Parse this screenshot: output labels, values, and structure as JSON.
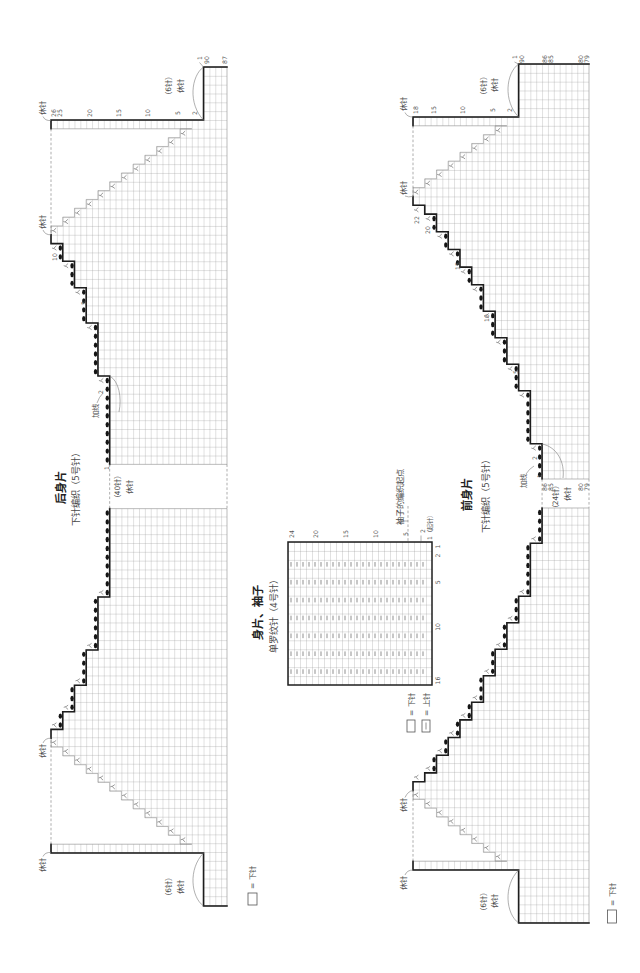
{
  "colors": {
    "outline": "#1e1e1e",
    "grid": "#8f8f8f",
    "dot": "#151515",
    "text": "#3a3a3a",
    "dashed": "#8a8a8a",
    "background": "#ffffff"
  },
  "symbols": {
    "decrease": "人",
    "cast_on": "●",
    "purl": "｜",
    "knit": "□"
  },
  "back_piece": {
    "title": "后身片",
    "subtitle": "下针编织（5号针）",
    "legend_text": "= 下针",
    "geometry": {
      "x0": 51,
      "y_top": 67,
      "cell_w": 5.867,
      "cell_h": 8.83,
      "strip_rows": 26,
      "total_rows": 30,
      "block_sts": 6,
      "dec_steps": 12,
      "arm_steps": [
        1,
        2,
        3,
        4,
        6
      ],
      "dot_from": 1,
      "gap_sts": 45,
      "mirror_sum": 973
    },
    "labels": [
      {
        "text": "1",
        "x": 199.2,
        "y": 58
      },
      {
        "text": "90",
        "x": 206.4,
        "y": 60
      },
      {
        "text": "87",
        "x": 224,
        "y": 60
      },
      {
        "text": "26",
        "x": 53.9,
        "y": 113
      },
      {
        "text": "25",
        "x": 59.8,
        "y": 113
      },
      {
        "text": "20",
        "x": 89.1,
        "y": 113
      },
      {
        "text": "15",
        "x": 118.5,
        "y": 113
      },
      {
        "text": "10",
        "x": 147.8,
        "y": 113
      },
      {
        "text": "5",
        "x": 177.2,
        "y": 113
      },
      {
        "text": "2",
        "x": 194.8,
        "y": 113
      },
      {
        "text": "10",
        "x": 54,
        "y": 257
      },
      {
        "text": "5",
        "x": 83.3,
        "y": 303
      },
      {
        "text": "2",
        "x": 100.9,
        "y": 392
      },
      {
        "text": "1",
        "x": 106.4,
        "y": 468
      },
      {
        "text": "休针",
        "x": 42,
        "y": 108,
        "cls": "note",
        "name": "held-stitches-label"
      },
      {
        "text": "休针",
        "x": 42,
        "y": 222,
        "cls": "note",
        "name": "held-stitches-label"
      },
      {
        "text": "（6针）",
        "x": 168.5,
        "y": 86,
        "cls": "note",
        "name": "stitch-count-label"
      },
      {
        "text": "休针",
        "x": 180,
        "y": 86,
        "cls": "note",
        "name": "held-stitches-label"
      },
      {
        "text": "加线",
        "x": 95,
        "y": 411,
        "cls": "note",
        "name": "join-yarn-label"
      },
      {
        "text": "（40针）",
        "x": 117,
        "y": 487,
        "cls": "note",
        "name": "stitch-count-label"
      },
      {
        "text": "休针",
        "x": 129,
        "y": 487,
        "cls": "note",
        "name": "held-stitches-label"
      },
      {
        "text": "休针",
        "x": 42,
        "y": 751,
        "cls": "note",
        "name": "held-stitches-label"
      },
      {
        "text": "休针",
        "x": 42,
        "y": 865,
        "cls": "note",
        "name": "held-stitches-label"
      },
      {
        "text": "（6针）",
        "x": 168.5,
        "y": 887,
        "cls": "note",
        "name": "stitch-count-label"
      },
      {
        "text": "休针",
        "x": 180,
        "y": 887,
        "cls": "note",
        "name": "held-stitches-label"
      }
    ],
    "leaders": [
      "M43,116.5 Q45,121 51,120.5",
      "M43,230 Q45,235 51,234.8",
      "M203.5,67 C191,76 188,104 203.5,120",
      "M43,856.5 Q45,852 51,852.5",
      "M43,743 Q45,738 51,738.2",
      "M203.5,906 C191,897 188,869 203.5,853",
      "M109.7,376 C119,381 122,398 119,412",
      "M97,403 Q99,397 103,393",
      "M199.5,62.5 L203.5,67"
    ]
  },
  "front_piece": {
    "title": "前身片",
    "subtitle": "下针编织（5号针）",
    "legend_text": "= 下针",
    "geometry": {
      "x0": 413,
      "y_top": 64,
      "cell_w": 5.867,
      "cell_h": 8.83,
      "strip_rows": 18,
      "total_rows": 30,
      "block_sts": 6,
      "dec_steps": 8,
      "arm_steps": [
        1,
        1,
        2,
        2,
        2,
        2,
        3,
        3,
        3,
        3,
        6
      ],
      "dot_from": 2,
      "gap_sts": 47,
      "mirror_sum": 987
    },
    "labels": [
      {
        "text": "1",
        "x": 514.5,
        "y": 57
      },
      {
        "text": "90",
        "x": 521.5,
        "y": 59
      },
      {
        "text": "86",
        "x": 544.9,
        "y": 59
      },
      {
        "text": "85",
        "x": 550.8,
        "y": 59
      },
      {
        "text": "80",
        "x": 580.1,
        "y": 59
      },
      {
        "text": "79",
        "x": 586,
        "y": 59
      },
      {
        "text": "18",
        "x": 415.9,
        "y": 110
      },
      {
        "text": "15",
        "x": 433.5,
        "y": 110
      },
      {
        "text": "10",
        "x": 462.8,
        "y": 110
      },
      {
        "text": "5",
        "x": 492.2,
        "y": 110
      },
      {
        "text": "2",
        "x": 509.8,
        "y": 110
      },
      {
        "text": "22",
        "x": 416,
        "y": 220
      },
      {
        "text": "20",
        "x": 427.7,
        "y": 230
      },
      {
        "text": "15",
        "x": 457,
        "y": 266
      },
      {
        "text": "10",
        "x": 486.4,
        "y": 318
      },
      {
        "text": "5",
        "x": 515.7,
        "y": 372
      },
      {
        "text": "2",
        "x": 534,
        "y": 458
      },
      {
        "text": "1",
        "x": 539.2,
        "y": 476
      },
      {
        "text": "86",
        "x": 544.9,
        "y": 487
      },
      {
        "text": "85",
        "x": 550.8,
        "y": 487
      },
      {
        "text": "80",
        "x": 580.1,
        "y": 487
      },
      {
        "text": "79",
        "x": 586,
        "y": 487
      },
      {
        "text": "休针",
        "x": 403,
        "y": 104,
        "cls": "note",
        "name": "held-stitches-label"
      },
      {
        "text": "休针",
        "x": 403,
        "y": 188,
        "cls": "note",
        "name": "held-stitches-label"
      },
      {
        "text": "（6针）",
        "x": 483,
        "y": 86,
        "cls": "note",
        "name": "stitch-count-label"
      },
      {
        "text": "休针",
        "x": 494,
        "y": 85,
        "cls": "note",
        "name": "held-stitches-label"
      },
      {
        "text": "加线",
        "x": 523,
        "y": 481,
        "cls": "note",
        "name": "join-yarn-label"
      },
      {
        "text": "（24针）",
        "x": 555,
        "y": 497,
        "cls": "note",
        "name": "stitch-count-label"
      },
      {
        "text": "休针",
        "x": 567,
        "y": 494,
        "cls": "note",
        "name": "held-stitches-label"
      },
      {
        "text": "休针",
        "x": 403,
        "y": 805,
        "cls": "note",
        "name": "held-stitches-label"
      },
      {
        "text": "休针",
        "x": 403,
        "y": 883,
        "cls": "note",
        "name": "held-stitches-label"
      },
      {
        "text": "（6针）",
        "x": 483,
        "y": 902,
        "cls": "note",
        "name": "stitch-count-label"
      },
      {
        "text": "休针",
        "x": 494,
        "y": 901,
        "cls": "note",
        "name": "held-stitches-label"
      }
    ],
    "leaders": [
      "M405,112.5 Q407,117 413,117",
      "M405,196 Q408,197.5 413,196.45",
      "M518.6,64 C506,73 503,101 518.6,117",
      "M405,875 Q407,870 413,870",
      "M405,797.5 Q408,791 413,790.55",
      "M518.6,923 C506,914 503,886 518.6,870",
      "M542.1,444 C557,447 565,462 563,478",
      "M526,474 Q529,469 534,466",
      "M514.5,62 L518.6,64"
    ]
  },
  "rib_chart": {
    "title": "身片、袖子",
    "subtitle": "单罗纹针（4号针）",
    "geometry": {
      "x": 288,
      "y": 542,
      "cell_w": 6,
      "cell_h": 8.9375,
      "rows": 24,
      "stitches": 16,
      "purl_stitches": [
        3,
        5,
        7,
        9,
        11,
        13,
        15
      ],
      "purl_rows": [
        2,
        24
      ],
      "row_label_y": 534,
      "stitch_label_x": 437
    },
    "row_labels": [
      {
        "row": 24,
        "text": "24"
      },
      {
        "row": 20,
        "text": "20"
      },
      {
        "row": 15,
        "text": "15"
      },
      {
        "row": 10,
        "text": "10"
      },
      {
        "row": 5,
        "text": "5"
      }
    ],
    "stitch_labels": [
      {
        "stitch": 1,
        "text": "1"
      },
      {
        "stitch": 2,
        "text": "2"
      },
      {
        "stitch": 5,
        "text": "5"
      },
      {
        "stitch": 10,
        "text": "10"
      },
      {
        "stitch": 16,
        "text": "16"
      }
    ],
    "notes": [
      {
        "text": "2",
        "x": 422,
        "y": 531,
        "name": "row-number-label"
      },
      {
        "text": "1（起针）",
        "x": 429,
        "y": 540,
        "anchor": "start",
        "name": "cast-on-row-label"
      },
      {
        "text": "袖子的编织起点",
        "x": 400,
        "y": 497,
        "cls": "note-lg",
        "name": "sleeve-start-label"
      }
    ],
    "dashed": [
      "M408,506 L408,541"
    ],
    "leaders": [
      "M401,521 L408,521",
      "M421,535.5 L421,541"
    ],
    "legend": {
      "knit_text": "= 下针",
      "purl_text": "= 上针"
    }
  }
}
